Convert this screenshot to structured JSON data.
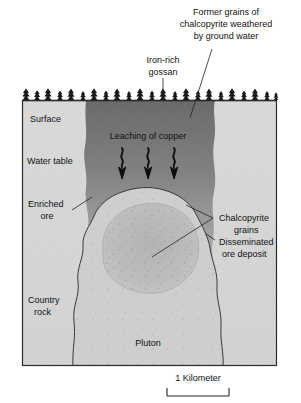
{
  "figure": {
    "type": "geologic-cross-section",
    "scale_bar": {
      "label": "1 Kilometer",
      "length_px": 62
    },
    "frame": {
      "left": 22,
      "top": 100,
      "right": 277,
      "bottom": 366
    },
    "colors": {
      "country_rock": "#dcdcdc",
      "pluton": "#cfcfcf",
      "ore_deposit": "#bcbcbc",
      "gossan_dark": "#6e6e6e",
      "leached_mid": "#9a9a9a",
      "enriched_light": "#c9c9c9",
      "outline": "#333333",
      "text": "#111111",
      "background": "#ffffff"
    }
  },
  "callouts": {
    "former_grains": {
      "lines": [
        "Former grains of",
        "chalcopyrite weathered",
        "by ground water"
      ]
    },
    "iron_rich_gossan": {
      "lines": [
        "Iron-rich",
        "gossan"
      ]
    },
    "chalcopyrite_grains": {
      "lines": [
        "Chalcopyrite",
        "grains"
      ]
    },
    "disseminated_ore": {
      "lines": [
        "Disseminated",
        "ore deposit"
      ]
    },
    "enriched_ore": {
      "lines": [
        "Enriched",
        "ore"
      ]
    },
    "country_rock": {
      "lines": [
        "Country",
        "rock"
      ]
    }
  },
  "inline_labels": {
    "surface": "Surface",
    "water_table": "Water table",
    "leaching": "Leaching of copper",
    "pluton": "Pluton"
  },
  "arrows": {
    "count": 3,
    "meaning": "downward percolation of copper-bearing solutions"
  }
}
